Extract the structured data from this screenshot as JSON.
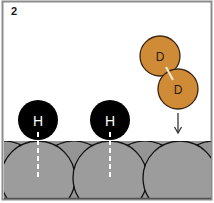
{
  "panel": {
    "label": "2"
  },
  "atoms": {
    "hydrogen": [
      {
        "symbol": "H",
        "cx": 38,
        "cy": 120,
        "r": 20
      },
      {
        "symbol": "H",
        "cx": 110,
        "cy": 120,
        "r": 20
      }
    ],
    "deuterium": [
      {
        "symbol": "D",
        "cx": 160,
        "cy": 56,
        "r": 20
      },
      {
        "symbol": "D",
        "cx": 178,
        "cy": 89,
        "r": 20
      }
    ]
  },
  "surface": {
    "atoms_count": 3
  },
  "colors": {
    "hydrogen": "#000000",
    "deuterium": "#cf8b35",
    "surface": "#9a9a9a",
    "outline": "#111111",
    "border": "#8c8c8c"
  }
}
